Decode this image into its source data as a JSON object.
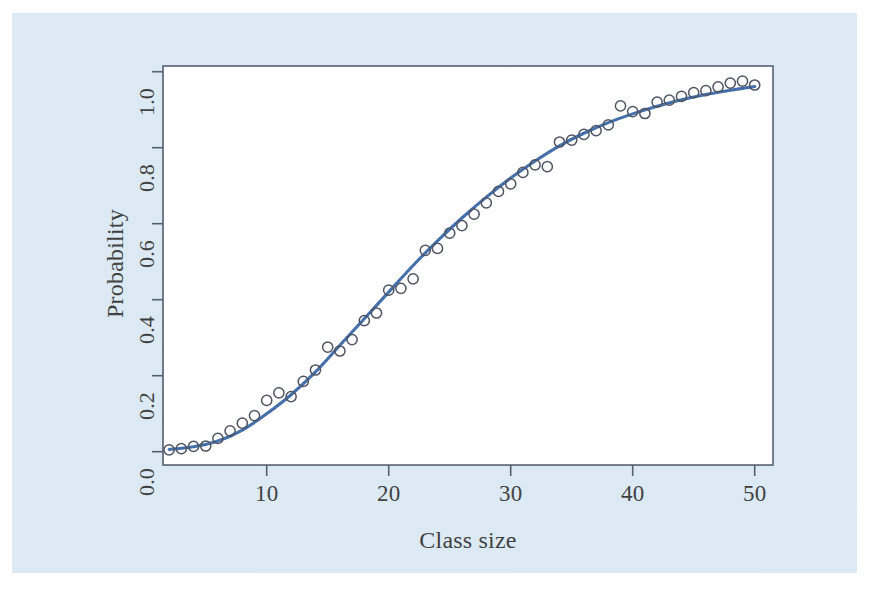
{
  "figure": {
    "background_color": "#dbe9f4",
    "page_color": "#ffffff",
    "axis_color": "#52596b",
    "marker_edge_color": "#4a4f5e",
    "curve_color": "#3f6ba8"
  },
  "chart_data": {
    "type": "scatter",
    "title": "",
    "subtitle": "",
    "xlabel": "Class size",
    "ylabel": "Probability",
    "xlim": [
      1.5,
      51.5
    ],
    "ylim": [
      -0.035,
      1.015
    ],
    "xticks": [
      10,
      20,
      30,
      40,
      50
    ],
    "xtick_labels": [
      "10",
      "20",
      "30",
      "40",
      "50"
    ],
    "yticks": [
      0.0,
      0.2,
      0.4,
      0.6,
      0.8,
      1.0
    ],
    "ytick_labels": [
      "0.0",
      "0.2",
      "0.4",
      "0.6",
      "0.8",
      "1.0"
    ],
    "grid": false,
    "legend": null,
    "box_frame": true,
    "series": [
      {
        "name": "Observed proportions",
        "type": "scatter",
        "marker": "open-circle",
        "x": [
          2,
          3,
          4,
          5,
          6,
          7,
          8,
          9,
          10,
          11,
          12,
          13,
          14,
          15,
          16,
          17,
          18,
          19,
          20,
          21,
          22,
          23,
          24,
          25,
          26,
          27,
          28,
          29,
          30,
          31,
          32,
          33,
          34,
          35,
          36,
          37,
          38,
          39,
          40,
          41,
          42,
          43,
          44,
          45,
          46,
          47,
          48,
          49,
          50
        ],
        "y": [
          0.005,
          0.008,
          0.014,
          0.015,
          0.035,
          0.055,
          0.075,
          0.095,
          0.135,
          0.155,
          0.145,
          0.185,
          0.215,
          0.275,
          0.265,
          0.295,
          0.345,
          0.365,
          0.425,
          0.43,
          0.455,
          0.53,
          0.535,
          0.575,
          0.595,
          0.625,
          0.655,
          0.685,
          0.705,
          0.735,
          0.755,
          0.75,
          0.815,
          0.82,
          0.835,
          0.845,
          0.86,
          0.91,
          0.895,
          0.89,
          0.92,
          0.925,
          0.935,
          0.945,
          0.95,
          0.96,
          0.97,
          0.975,
          0.965
        ]
      },
      {
        "name": "Fitted logistic curve",
        "type": "line",
        "x": [
          2,
          4,
          6,
          8,
          10,
          12,
          14,
          16,
          18,
          20,
          22,
          24,
          26,
          28,
          30,
          32,
          34,
          36,
          38,
          40,
          42,
          44,
          46,
          48,
          50
        ],
        "y": [
          0.006,
          0.013,
          0.028,
          0.057,
          0.1,
          0.15,
          0.21,
          0.28,
          0.35,
          0.42,
          0.49,
          0.555,
          0.615,
          0.67,
          0.72,
          0.765,
          0.805,
          0.838,
          0.866,
          0.889,
          0.909,
          0.926,
          0.94,
          0.951,
          0.961
        ]
      }
    ]
  }
}
